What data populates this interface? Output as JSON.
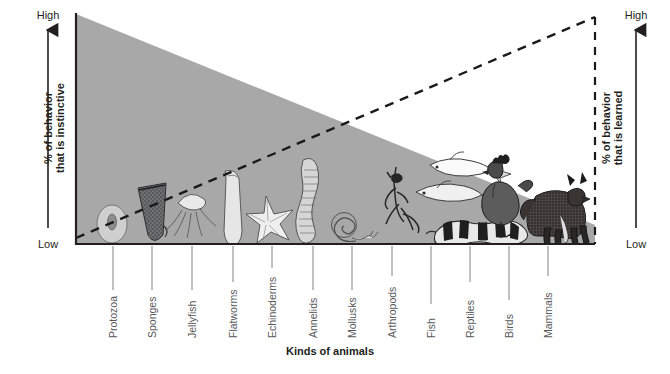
{
  "figure": {
    "x_axis_title": "Kinds of animals",
    "left_axis": {
      "label_line1": "% of behavior",
      "label_line2": "that is instinctive",
      "high_label": "High",
      "low_label": "Low"
    },
    "right_axis": {
      "label_line1": "% of behavior",
      "label_line2": "that is learned",
      "high_label": "High",
      "low_label": "Low"
    },
    "colors": {
      "instinct_region": "#a8a8a8",
      "learned_region": "#ffffff",
      "axis_line": "#231f20",
      "leader_line": "#808285",
      "label_text": "#58595b"
    }
  },
  "chart_data": {
    "type": "area",
    "xlabel": "Kinds of animals",
    "ylabel": "% of behavior that is instinctive",
    "ylabel_right": "% of behavior that is learned",
    "ylim": [
      0,
      100
    ],
    "ytick_labels": [
      "Low",
      "High"
    ],
    "grid": false,
    "legend": "none",
    "categories": [
      "Protozoa",
      "Sponges",
      "Jellyfish",
      "Flatworms",
      "Echinoderms",
      "Annelids",
      "Mollusks",
      "Arthropods",
      "Fish",
      "Reptiles",
      "Birds",
      "Mammals"
    ],
    "series": [
      {
        "name": "% of behavior that is instinctive",
        "values": [
          100,
          94,
          88,
          81,
          75,
          68,
          62,
          55,
          49,
          42,
          36,
          30
        ]
      },
      {
        "name": "% of behavior that is learned (dashed reference line)",
        "values": [
          0,
          9,
          18,
          27,
          36,
          45,
          55,
          64,
          73,
          82,
          91,
          100
        ]
      }
    ],
    "annotations": [
      "Shaded region height = proportion of behavior that is instinctive",
      "Dashed diagonal line = proportion of behavior that is learned",
      "Instinct decreases and learning increases from protozoa to mammals"
    ]
  },
  "animals": [
    {
      "name": "Protozoa",
      "icon": "amoeba-icon"
    },
    {
      "name": "Sponges",
      "icon": "sponge-icon"
    },
    {
      "name": "Jellyfish",
      "icon": "jellyfish-icon"
    },
    {
      "name": "Flatworms",
      "icon": "flatworm-icon"
    },
    {
      "name": "Echinoderms",
      "icon": "starfish-icon"
    },
    {
      "name": "Annelids",
      "icon": "earthworm-icon"
    },
    {
      "name": "Mollusks",
      "icon": "snail-icon"
    },
    {
      "name": "Arthropods",
      "icon": "mantis-icon"
    },
    {
      "name": "Fish",
      "icon": "fish-icon"
    },
    {
      "name": "Reptiles",
      "icon": "snake-icon"
    },
    {
      "name": "Birds",
      "icon": "chicken-icon"
    },
    {
      "name": "Mammals",
      "icon": "dog-icon"
    }
  ]
}
